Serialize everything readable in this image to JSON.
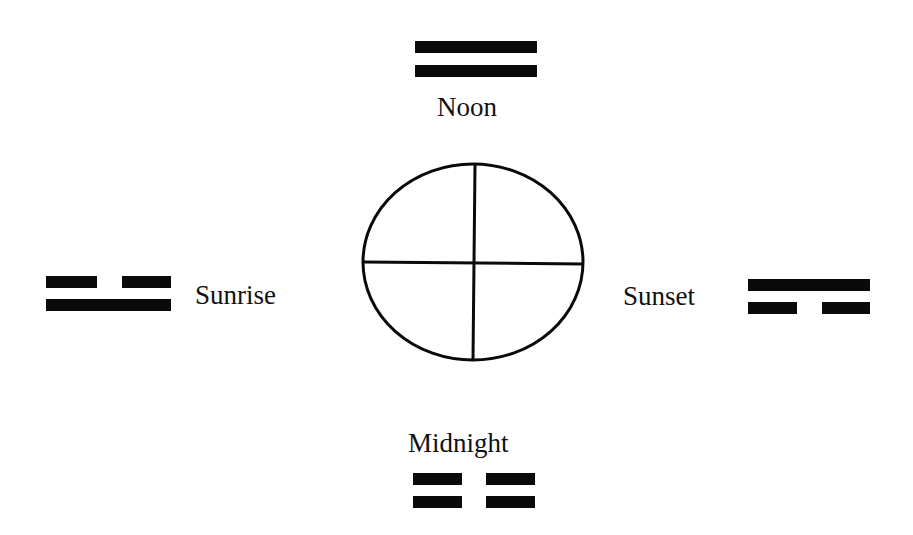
{
  "diagram": {
    "center_symbol": "circle-with-cross",
    "positions": [
      {
        "id": "noon",
        "label": "Noon",
        "direction": "top",
        "trigram_lines": [
          "solid",
          "solid"
        ]
      },
      {
        "id": "sunrise",
        "label": "Sunrise",
        "direction": "left",
        "trigram_lines": [
          "broken",
          "solid"
        ]
      },
      {
        "id": "sunset",
        "label": "Sunset",
        "direction": "right",
        "trigram_lines": [
          "solid",
          "broken"
        ]
      },
      {
        "id": "midnight",
        "label": "Midnight",
        "direction": "bottom",
        "trigram_lines": [
          "broken",
          "broken"
        ]
      }
    ],
    "colors": {
      "ink": "#0a0a0a",
      "background": "#ffffff"
    }
  }
}
